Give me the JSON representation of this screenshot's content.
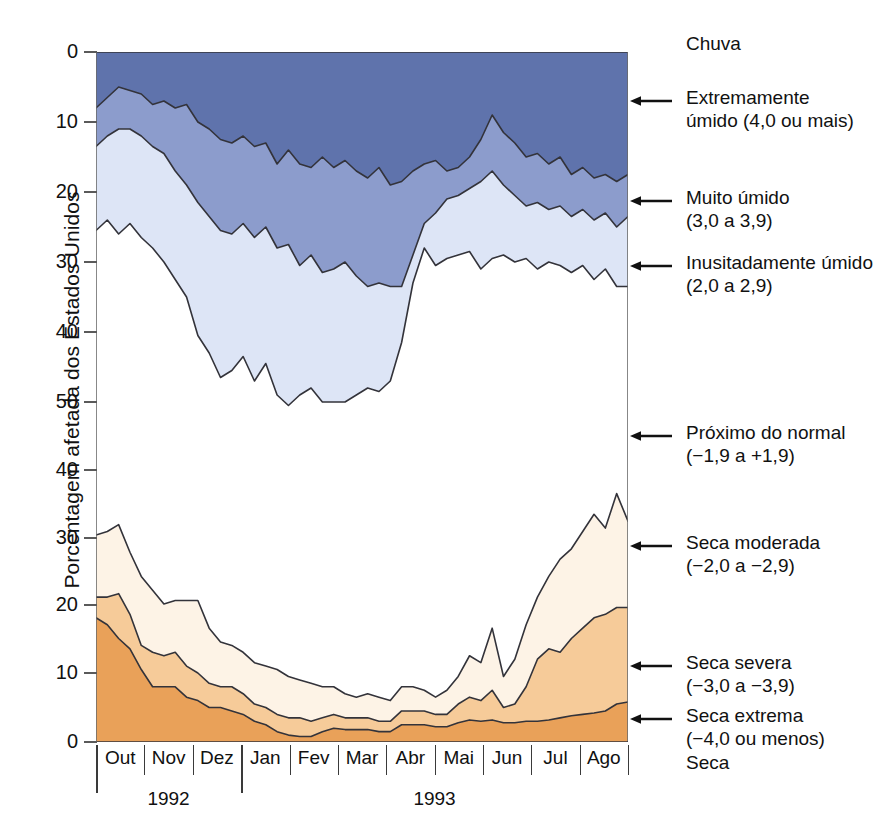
{
  "chart_data": {
    "type": "area",
    "title": "",
    "ylabel": "Porcentagem afetada dos Estados Unidos",
    "xlabel": "",
    "grid": false,
    "legend_position": "right",
    "axis_note": "Eixo Y espelhado: metade superior (chuva) 0-50 descendo, metade inferior (seca) 50-0 descendo",
    "y_ticks_top": [
      0,
      10,
      20,
      30,
      40,
      50
    ],
    "y_ticks_bottom": [
      40,
      30,
      20,
      10,
      0
    ],
    "x_months": [
      "Out",
      "Nov",
      "Dez",
      "Jan",
      "Fev",
      "Mar",
      "Abr",
      "Mai",
      "Jun",
      "Jul",
      "Ago"
    ],
    "x_years": [
      {
        "label": "1992",
        "months": [
          "Out",
          "Nov",
          "Dez"
        ]
      },
      {
        "label": "1993",
        "months": [
          "Jan",
          "Fev",
          "Mar",
          "Abr",
          "Mai",
          "Jun",
          "Jul",
          "Ago"
        ]
      }
    ],
    "x_range_weeks": 48,
    "series": [
      {
        "name": "Extremamente umido (4,0 ou mais)",
        "color": "#5f73ac",
        "stack": "wet",
        "order": 1,
        "values": [
          8.0,
          6.5,
          5.0,
          5.5,
          6.0,
          7.5,
          7.0,
          8.0,
          7.5,
          10.0,
          11.0,
          12.5,
          13.0,
          12.0,
          13.5,
          13.0,
          16.0,
          14.0,
          16.0,
          16.5,
          15.0,
          16.5,
          15.5,
          17.0,
          18.0,
          16.5,
          19.0,
          18.5,
          17.0,
          16.0,
          15.5,
          17.0,
          16.5,
          15.0,
          12.5,
          9.0,
          11.5,
          13.0,
          15.0,
          14.5,
          16.0,
          15.0,
          17.5,
          16.5,
          18.0,
          17.5,
          18.5,
          17.5
        ]
      },
      {
        "name": "Muito umido (3,0 a 3,9)",
        "color": "#8c9ccc",
        "stack": "wet",
        "order": 2,
        "values": [
          13.5,
          12.0,
          11.0,
          11.0,
          12.0,
          13.5,
          14.5,
          17.0,
          19.0,
          21.5,
          23.5,
          25.5,
          26.0,
          24.5,
          26.5,
          25.0,
          28.0,
          27.5,
          30.5,
          29.0,
          31.5,
          31.0,
          30.0,
          32.0,
          33.5,
          33.0,
          33.5,
          33.5,
          29.0,
          24.5,
          23.0,
          21.0,
          20.5,
          19.5,
          18.5,
          17.0,
          19.0,
          20.5,
          22.0,
          21.5,
          22.5,
          22.0,
          23.5,
          22.5,
          24.0,
          23.0,
          25.0,
          23.5
        ]
      },
      {
        "name": "Inusitadamente umido (2,0 a 2,9)",
        "color": "#dde5f6",
        "stack": "wet",
        "order": 3,
        "values": [
          25.5,
          24.0,
          26.0,
          24.5,
          26.5,
          28.0,
          30.0,
          32.5,
          35.0,
          40.5,
          43.0,
          46.5,
          45.5,
          43.5,
          47.0,
          44.5,
          49.0,
          50.5,
          49.0,
          48.0,
          50.0,
          50.0,
          50.0,
          49.0,
          48.0,
          48.5,
          47.0,
          41.5,
          33.0,
          28.0,
          30.5,
          29.5,
          29.0,
          28.5,
          31.0,
          29.5,
          29.0,
          30.0,
          29.5,
          31.0,
          30.0,
          30.5,
          31.5,
          30.5,
          32.5,
          31.0,
          33.5,
          33.5
        ]
      },
      {
        "name": "Seca moderada (-2,0 a -2,9)",
        "color": "#fdf3e6",
        "stack": "dry",
        "order": 3,
        "values": [
          30.0,
          30.5,
          31.5,
          27.5,
          24.0,
          22.0,
          20.0,
          20.5,
          20.5,
          20.5,
          16.5,
          14.5,
          14.0,
          13.0,
          11.5,
          11.0,
          10.5,
          9.5,
          9.0,
          8.5,
          8.0,
          8.0,
          7.0,
          6.5,
          7.0,
          6.5,
          6.0,
          8.0,
          8.0,
          7.5,
          6.5,
          7.5,
          9.5,
          12.5,
          11.5,
          16.5,
          9.5,
          12.0,
          17.0,
          21.0,
          24.0,
          26.5,
          28.0,
          30.5,
          33.0,
          31.0,
          36.0,
          32.0
        ]
      },
      {
        "name": "Seca severa (-3,0 a -3,9)",
        "color": "#f6cb99",
        "stack": "dry",
        "order": 2,
        "values": [
          21.0,
          21.0,
          21.5,
          18.5,
          14.0,
          13.0,
          12.5,
          13.0,
          11.0,
          10.0,
          8.5,
          8.0,
          8.0,
          7.0,
          5.5,
          5.0,
          4.0,
          3.5,
          3.5,
          3.0,
          3.5,
          4.0,
          3.5,
          3.5,
          3.5,
          3.0,
          3.0,
          4.5,
          4.5,
          4.5,
          4.0,
          4.0,
          5.5,
          6.5,
          6.0,
          7.5,
          5.0,
          5.5,
          8.0,
          12.0,
          13.5,
          13.0,
          15.0,
          16.5,
          18.0,
          18.5,
          19.5,
          19.5
        ]
      },
      {
        "name": "Seca extrema (-4,0 ou menos)",
        "color": "#e9a159",
        "stack": "dry",
        "order": 1,
        "values": [
          18.0,
          17.0,
          15.0,
          13.5,
          10.5,
          8.0,
          8.0,
          8.0,
          6.5,
          6.0,
          5.0,
          5.0,
          4.5,
          4.0,
          3.0,
          2.5,
          1.5,
          1.0,
          0.8,
          0.8,
          1.5,
          2.0,
          1.8,
          1.8,
          1.8,
          1.5,
          1.5,
          2.5,
          2.5,
          2.5,
          2.2,
          2.2,
          2.8,
          3.2,
          3.0,
          3.2,
          2.8,
          2.8,
          3.0,
          3.0,
          3.2,
          3.5,
          3.8,
          4.0,
          4.2,
          4.5,
          5.5,
          5.8
        ]
      }
    ]
  },
  "legend": {
    "top_caption": "Chuva",
    "bottom_caption": "Seca",
    "entries": [
      {
        "line1": "Extremamente",
        "line2": "úmido (4,0 ou mais)",
        "y": 100
      },
      {
        "line1": "Muito úmido",
        "line2": "(3,0 a 3,9)",
        "y": 200
      },
      {
        "line1": "Inusitadamente úmido",
        "line2": "(2,0 a 2,9)",
        "y": 265
      },
      {
        "line1": "Próximo do normal",
        "line2": "(−1,9 a +1,9)",
        "y": 435
      },
      {
        "line1": "Seca moderada",
        "line2": "(−2,0 a −2,9)",
        "y": 545
      },
      {
        "line1": "Seca severa",
        "line2": "(−3,0 a −3,9)",
        "y": 665
      },
      {
        "line1": "Seca extrema",
        "line2": "(−4,0 ou menos)",
        "y": 718
      }
    ]
  },
  "axis": {
    "y_title": "Porcentagem afetada dos Estados Unidos",
    "y_ticks": [
      {
        "label": "0",
        "y": 52
      },
      {
        "label": "10",
        "y": 122
      },
      {
        "label": "20",
        "y": 192
      },
      {
        "label": "30",
        "y": 262
      },
      {
        "label": "40",
        "y": 332
      },
      {
        "label": "50",
        "y": 402
      },
      {
        "label": "40",
        "y": 470
      },
      {
        "label": "30",
        "y": 538
      },
      {
        "label": "20",
        "y": 605
      },
      {
        "label": "10",
        "y": 673
      },
      {
        "label": "0",
        "y": 742
      }
    ]
  },
  "colors": {
    "extremely_wet": "#5f73ac",
    "very_wet": "#8c9ccc",
    "unusually_wet": "#dde5f6",
    "near_normal": "#ffffff",
    "moderate_drought": "#fdf3e6",
    "severe_drought": "#f6cb99",
    "extreme_drought": "#e9a159",
    "outline": "#33333a",
    "axis": "#5a5a5a"
  }
}
